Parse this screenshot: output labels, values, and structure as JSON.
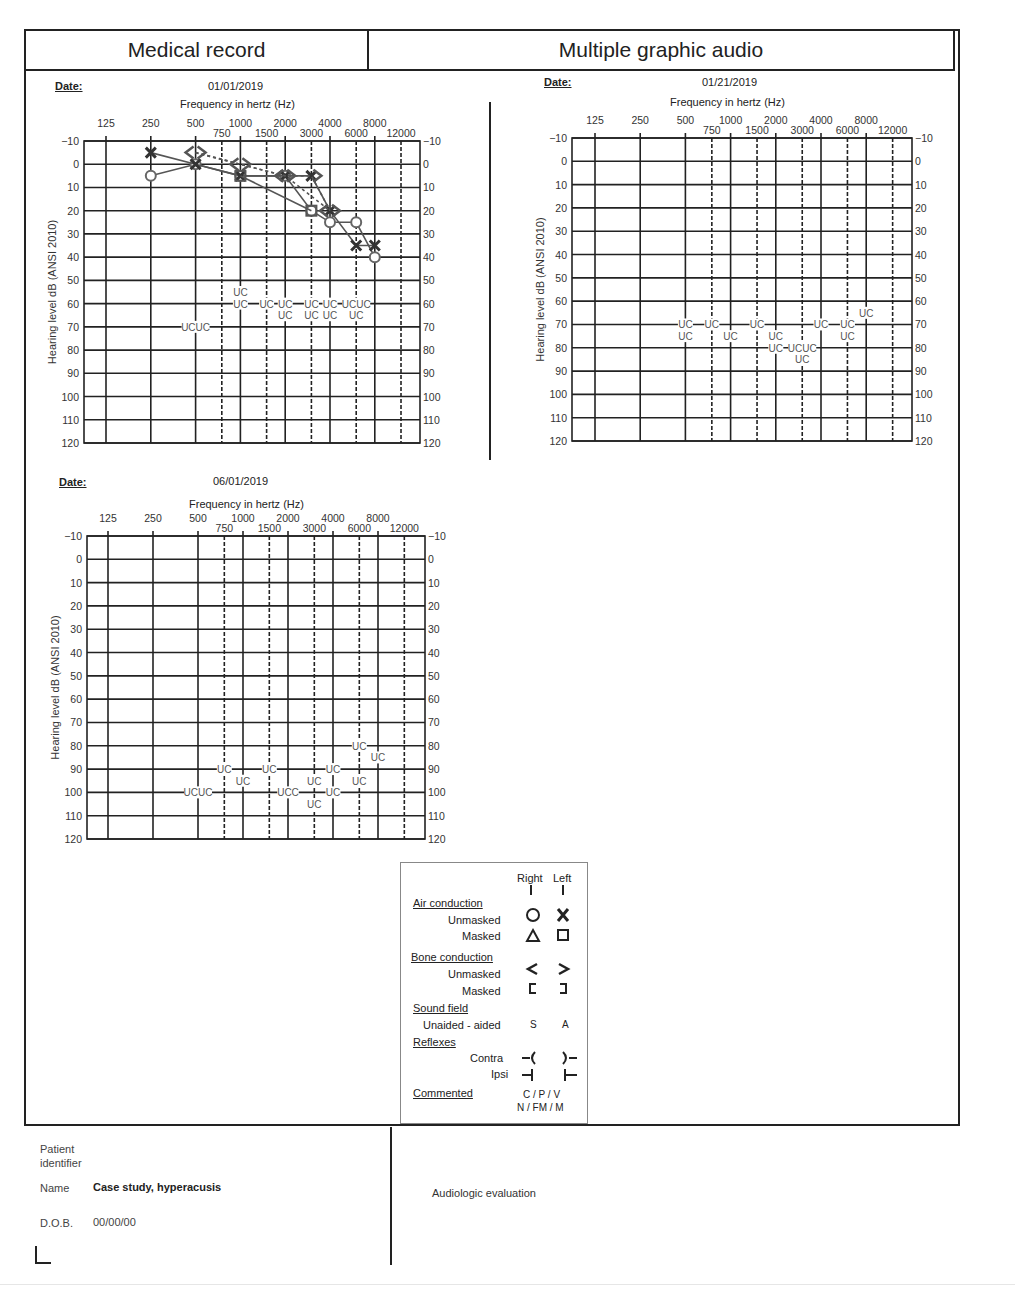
{
  "header": {
    "left_title": "Medical record",
    "right_title": "Multiple graphic audio"
  },
  "date_label": "Date:",
  "freq_title": "Frequency in hertz (Hz)",
  "y_axis_label": "Hearing level dB (ANSI 2010)",
  "charts": [
    {
      "date": "01/01/2019"
    },
    {
      "date": "01/21/2019"
    },
    {
      "date": "06/01/2019"
    }
  ],
  "legend": {
    "col_right": "Right",
    "col_left": "Left",
    "air_conduction": "Air conduction",
    "unmasked": "Unmasked",
    "masked": "Masked",
    "bone_conduction": "Bone conduction",
    "sound_field": "Sound field",
    "unaided_aided": "Unaided - aided",
    "sf_right": "S",
    "sf_left": "A",
    "reflexes": "Reflexes",
    "contra": "Contra",
    "ipsi": "Ipsi",
    "commented": "Commented",
    "commented_codes_1": "C / P / V",
    "commented_codes_2": "N / FM / M"
  },
  "footer": {
    "patient_identifier_1": "Patient",
    "patient_identifier_2": "identifier",
    "name_label": "Name",
    "name_value": "Case study, hyperacusis",
    "dob_label": "D.O.B.",
    "dob_value": "00/00/00",
    "evaluation": "Audiologic evaluation"
  },
  "chart_data": [
    {
      "type": "line",
      "title": "01/01/2019",
      "xlabel": "Frequency in hertz (Hz)",
      "ylabel": "Hearing level dB (ANSI 2010)",
      "x_major_ticks": [
        125,
        250,
        500,
        1000,
        2000,
        4000,
        8000
      ],
      "x_minor_ticks": [
        750,
        1500,
        3000,
        6000,
        12000
      ],
      "y_ticks": [
        -10,
        0,
        10,
        20,
        30,
        40,
        50,
        60,
        70,
        80,
        90,
        100,
        110,
        120
      ],
      "ylim": [
        -10,
        120
      ],
      "grid": true,
      "series": [
        {
          "name": "Right air unmasked (O)",
          "x": [
            250,
            500,
            1000,
            2000,
            3000,
            4000,
            6000,
            8000
          ],
          "values": [
            5,
            0,
            5,
            5,
            20,
            25,
            25,
            40
          ]
        },
        {
          "name": "Left air unmasked (X)",
          "x": [
            250,
            500,
            1000,
            2000,
            3000,
            4000,
            6000,
            8000
          ],
          "values": [
            -5,
            0,
            5,
            5,
            5,
            20,
            35,
            35
          ]
        },
        {
          "name": "Right bone unmasked (<)",
          "x": [
            500,
            1000,
            2000,
            4000
          ],
          "values": [
            -5,
            0,
            5,
            20
          ]
        },
        {
          "name": "Left bone unmasked (>)",
          "x": [
            500,
            1000,
            2000,
            3000,
            4000
          ],
          "values": [
            -5,
            0,
            5,
            5,
            20
          ]
        },
        {
          "name": "Left air masked (square)",
          "x": [
            1000,
            3000
          ],
          "values": [
            5,
            20
          ]
        }
      ],
      "uc_annotations": [
        {
          "x": 500,
          "y": 70,
          "label": "UCUC"
        },
        {
          "x": 1000,
          "y": 55,
          "label": "UC"
        },
        {
          "x": 1000,
          "y": 60,
          "label": "UC"
        },
        {
          "x": 1500,
          "y": 60,
          "label": "UC"
        },
        {
          "x": 2000,
          "y": 60,
          "label": "UC"
        },
        {
          "x": 2000,
          "y": 65,
          "label": "UC"
        },
        {
          "x": 3000,
          "y": 60,
          "label": "UC"
        },
        {
          "x": 3000,
          "y": 65,
          "label": "UC"
        },
        {
          "x": 4000,
          "y": 60,
          "label": "UC"
        },
        {
          "x": 4000,
          "y": 65,
          "label": "UC"
        },
        {
          "x": 6000,
          "y": 60,
          "label": "UCUC"
        },
        {
          "x": 6000,
          "y": 65,
          "label": "UC"
        }
      ]
    },
    {
      "type": "line",
      "title": "01/21/2019",
      "xlabel": "Frequency in hertz (Hz)",
      "ylabel": "Hearing level dB (ANSI 2010)",
      "x_major_ticks": [
        125,
        250,
        500,
        1000,
        2000,
        4000,
        8000
      ],
      "x_minor_ticks": [
        750,
        1500,
        3000,
        6000,
        12000
      ],
      "y_ticks": [
        -10,
        0,
        10,
        20,
        30,
        40,
        50,
        60,
        70,
        80,
        90,
        100,
        110,
        120
      ],
      "ylim": [
        -10,
        120
      ],
      "grid": true,
      "series": [],
      "uc_annotations": [
        {
          "x": 500,
          "y": 70,
          "label": "UC"
        },
        {
          "x": 500,
          "y": 75,
          "label": "UC"
        },
        {
          "x": 750,
          "y": 70,
          "label": "UC"
        },
        {
          "x": 1000,
          "y": 75,
          "label": "UC"
        },
        {
          "x": 1500,
          "y": 70,
          "label": "UC"
        },
        {
          "x": 2000,
          "y": 75,
          "label": "UC"
        },
        {
          "x": 2000,
          "y": 80,
          "label": "UC"
        },
        {
          "x": 3000,
          "y": 80,
          "label": "UCUC"
        },
        {
          "x": 3000,
          "y": 85,
          "label": "UC"
        },
        {
          "x": 4000,
          "y": 70,
          "label": "UC"
        },
        {
          "x": 6000,
          "y": 70,
          "label": "UC"
        },
        {
          "x": 6000,
          "y": 75,
          "label": "UC"
        },
        {
          "x": 8000,
          "y": 65,
          "label": "UC"
        }
      ]
    },
    {
      "type": "line",
      "title": "06/01/2019",
      "xlabel": "Frequency in hertz (Hz)",
      "ylabel": "Hearing level dB (ANSI 2010)",
      "x_major_ticks": [
        125,
        250,
        500,
        1000,
        2000,
        4000,
        8000
      ],
      "x_minor_ticks": [
        750,
        1500,
        3000,
        6000,
        12000
      ],
      "y_ticks": [
        -10,
        0,
        10,
        20,
        30,
        40,
        50,
        60,
        70,
        80,
        90,
        100,
        110,
        120
      ],
      "ylim": [
        -10,
        120
      ],
      "grid": true,
      "series": [],
      "uc_annotations": [
        {
          "x": 500,
          "y": 100,
          "label": "UCUC"
        },
        {
          "x": 750,
          "y": 90,
          "label": "UC"
        },
        {
          "x": 1000,
          "y": 95,
          "label": "UC"
        },
        {
          "x": 1500,
          "y": 90,
          "label": "UC"
        },
        {
          "x": 2000,
          "y": 100,
          "label": "UCC"
        },
        {
          "x": 3000,
          "y": 95,
          "label": "UC"
        },
        {
          "x": 3000,
          "y": 105,
          "label": "UC"
        },
        {
          "x": 4000,
          "y": 100,
          "label": "UC"
        },
        {
          "x": 4000,
          "y": 90,
          "label": "UC"
        },
        {
          "x": 6000,
          "y": 95,
          "label": "UC"
        },
        {
          "x": 6000,
          "y": 80,
          "label": "UC"
        },
        {
          "x": 8000,
          "y": 85,
          "label": "UC"
        }
      ]
    }
  ]
}
